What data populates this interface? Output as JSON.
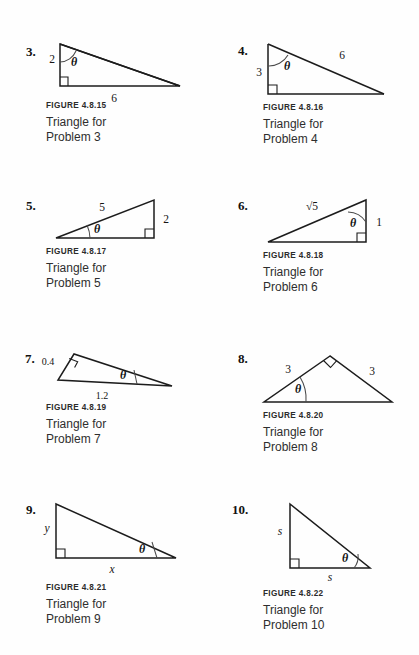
{
  "page": {
    "background": "#fefefe",
    "ink": "#1c1c1c",
    "width": 419,
    "height": 655
  },
  "problems": [
    {
      "number": "3.",
      "figure_id": "FIGURE 4.8.15",
      "caption_line1": "Triangle for",
      "caption_line2": "Problem 3",
      "angle_label": "θ",
      "angle_vertex": "top-left",
      "right_angle_vertex": "bottom-left",
      "labels": {
        "leg_vertical": "2",
        "base": "6"
      },
      "description": "Right triangle, vertical leg 2 on the left, horizontal base 6, theta at the top vertex."
    },
    {
      "number": "4.",
      "figure_id": "FIGURE 4.8.16",
      "caption_line1": "Triangle for",
      "caption_line2": "Problem 4",
      "angle_label": "θ",
      "angle_vertex": "top-left",
      "right_angle_vertex": "bottom-left",
      "labels": {
        "leg_vertical": "3",
        "hypotenuse": "6"
      },
      "description": "Right triangle, vertical leg 3 on the left, hypotenuse 6, theta at the top vertex."
    },
    {
      "number": "5.",
      "figure_id": "FIGURE 4.8.17",
      "caption_line1": "Triangle for",
      "caption_line2": "Problem 5",
      "angle_label": "θ",
      "angle_vertex": "bottom-left",
      "right_angle_vertex": "bottom-right",
      "labels": {
        "hypotenuse": "5",
        "leg_vertical": "2"
      },
      "description": "Right triangle, hypotenuse 5 along the top, vertical right leg 2, theta at the bottom-left vertex."
    },
    {
      "number": "6.",
      "figure_id": "FIGURE 4.8.18",
      "caption_line1": "Triangle for",
      "caption_line2": "Problem 6",
      "angle_label": "θ",
      "angle_vertex": "top-right",
      "right_angle_vertex": "bottom-right",
      "labels": {
        "hypotenuse": "√5",
        "leg_vertical": "1"
      },
      "description": "Right triangle, hypotenuse labelled radical 5, vertical right leg 1, theta at the top-right vertex."
    },
    {
      "number": "7.",
      "figure_id": "FIGURE 4.8.19",
      "caption_line1": "Triangle for",
      "caption_line2": "Problem 7",
      "angle_label": "θ",
      "angle_vertex": "bottom-right",
      "right_angle_vertex": "top-left",
      "labels": {
        "leg_left": "0.4",
        "base": "1.2"
      },
      "description": "Right triangle with the right angle at the upper-left apex, short left side 0.4, base 1.2, theta at the bottom-right vertex."
    },
    {
      "number": "8.",
      "figure_id": "FIGURE 4.8.20",
      "caption_line1": "Triangle for",
      "caption_line2": "Problem 8",
      "angle_label": "θ",
      "angle_vertex": "bottom-left",
      "right_angle_vertex": "apex",
      "labels": {
        "side_left": "3",
        "side_right": "3"
      },
      "description": "Isosceles right triangle with the right angle at the top apex, both equal sides labelled 3, theta at the bottom-left vertex."
    },
    {
      "number": "9.",
      "figure_id": "FIGURE 4.8.21",
      "caption_line1": "Triangle for",
      "caption_line2": "Problem 9",
      "angle_label": "θ",
      "angle_vertex": "bottom-right",
      "right_angle_vertex": "bottom-left",
      "labels": {
        "leg_vertical": "y",
        "base": "x"
      },
      "description": "Right triangle, vertical leg y, horizontal base x, theta at the bottom-right vertex."
    },
    {
      "number": "10.",
      "figure_id": "FIGURE 4.8.22",
      "caption_line1": "Triangle for",
      "caption_line2": "Problem 10",
      "angle_label": "θ",
      "angle_vertex": "bottom-right",
      "right_angle_vertex": "bottom-left",
      "labels": {
        "leg_vertical": "s",
        "base": "s"
      },
      "description": "Isosceles right triangle, vertical leg s, horizontal base s, theta at the bottom-right vertex."
    }
  ]
}
